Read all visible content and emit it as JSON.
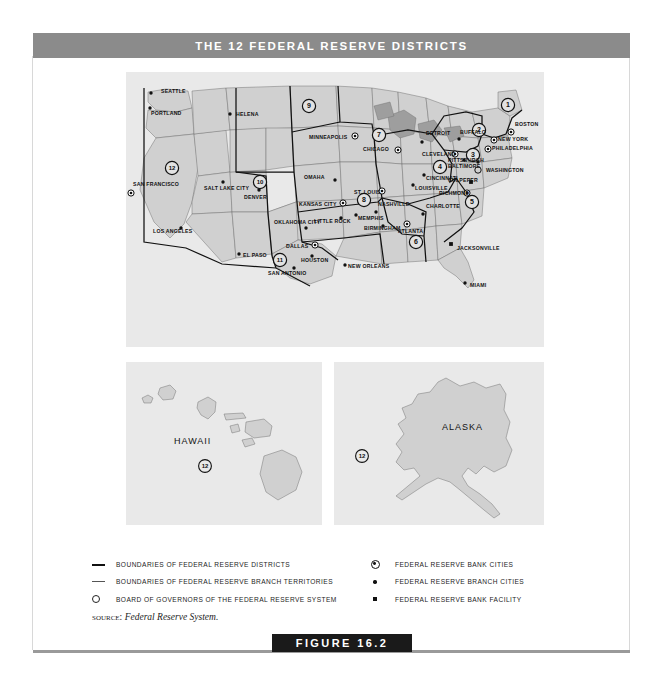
{
  "header": {
    "title_prefix": "T",
    "title": "THE 12 FEDERAL RESERVE DISTRICTS"
  },
  "figure": {
    "banner_label": "FIGURE 16.2"
  },
  "source": {
    "label": "SOURCE:",
    "value": "Federal Reserve System."
  },
  "legend": {
    "left": [
      {
        "marker": "thick-line-icon",
        "label": "Boundaries of Federal Reserve Districts"
      },
      {
        "marker": "thin-line-icon",
        "label": "Boundaries of Federal Reserve Branch territories"
      },
      {
        "marker": "board-of-governors-icon",
        "label": "Board of Governors of the Federal Reserve System"
      }
    ],
    "right": [
      {
        "marker": "reserve-bank-city-icon",
        "label": "Federal Reserve Bank cities"
      },
      {
        "marker": "branch-city-icon",
        "label": "Federal Reserve Branch cities"
      },
      {
        "marker": "bank-facility-icon",
        "label": "Federal Reserve Bank facility"
      }
    ]
  },
  "maps": {
    "main": {
      "name": "continental-united-states",
      "districts": [
        {
          "number": "1",
          "x": 382,
          "y": 33
        },
        {
          "number": "2",
          "x": 353,
          "y": 58
        },
        {
          "number": "3",
          "x": 347,
          "y": 83
        },
        {
          "number": "4",
          "x": 314,
          "y": 95
        },
        {
          "number": "5",
          "x": 346,
          "y": 130
        },
        {
          "number": "6",
          "x": 290,
          "y": 170
        },
        {
          "number": "7",
          "x": 253,
          "y": 63
        },
        {
          "number": "8",
          "x": 238,
          "y": 128
        },
        {
          "number": "9",
          "x": 183,
          "y": 34
        },
        {
          "number": "10",
          "x": 134,
          "y": 110
        },
        {
          "number": "11",
          "x": 154,
          "y": 188
        },
        {
          "number": "12",
          "x": 46,
          "y": 96
        }
      ],
      "cities": [
        {
          "name": "SEATTLE",
          "type": "branch",
          "lx": 35,
          "ly": 21,
          "dx": 25,
          "dy": 21,
          "anchor": "start"
        },
        {
          "name": "PORTLAND",
          "type": "branch",
          "lx": 25,
          "ly": 43,
          "dx": 24,
          "dy": 36,
          "anchor": "start"
        },
        {
          "name": "HELENA",
          "type": "branch",
          "lx": 110,
          "ly": 44,
          "dx": 104,
          "dy": 42,
          "anchor": "start"
        },
        {
          "name": "MINNEAPOLIS",
          "type": "bank",
          "lx": 183,
          "ly": 67,
          "dx": 229,
          "dy": 64,
          "anchor": "start"
        },
        {
          "name": "SAN FRANCISCO",
          "type": "bank",
          "lx": 7,
          "ly": 114,
          "dx": 5,
          "dy": 121,
          "anchor": "start"
        },
        {
          "name": "SALT LAKE CITY",
          "type": "branch",
          "lx": 78,
          "ly": 118,
          "dx": 97,
          "dy": 110,
          "anchor": "start"
        },
        {
          "name": "DENVER",
          "type": "branch",
          "lx": 118,
          "ly": 127,
          "dx": 133,
          "dy": 118,
          "anchor": "start"
        },
        {
          "name": "OMAHA",
          "type": "branch",
          "lx": 178,
          "ly": 107,
          "dx": 209,
          "dy": 108,
          "anchor": "start"
        },
        {
          "name": "KANSAS CITY",
          "type": "bank",
          "lx": 173,
          "ly": 134,
          "dx": 217,
          "dy": 131,
          "anchor": "start"
        },
        {
          "name": "CHICAGO",
          "type": "bank",
          "lx": 237,
          "ly": 79,
          "dx": 272,
          "dy": 78,
          "anchor": "start"
        },
        {
          "name": "DETROIT",
          "type": "branch",
          "lx": 300,
          "ly": 63,
          "dx": 296,
          "dy": 70,
          "anchor": "start"
        },
        {
          "name": "CLEVELAND",
          "type": "bank",
          "lx": 296,
          "ly": 84,
          "dx": 329,
          "dy": 82,
          "anchor": "start"
        },
        {
          "name": "ST. LOUIS",
          "type": "bank",
          "lx": 228,
          "ly": 122,
          "dx": 256,
          "dy": 119,
          "anchor": "start"
        },
        {
          "name": "LOUISVILLE",
          "type": "branch",
          "lx": 289,
          "ly": 118,
          "dx": 287,
          "dy": 113,
          "anchor": "start"
        },
        {
          "name": "CINCINNATI",
          "type": "branch",
          "lx": 300,
          "ly": 108,
          "dx": 298,
          "dy": 103,
          "anchor": "start"
        },
        {
          "name": "BUFFALO",
          "type": "branch",
          "lx": 334,
          "ly": 62,
          "dx": 333,
          "dy": 67,
          "anchor": "start"
        },
        {
          "name": "BOSTON",
          "type": "bank",
          "lx": 389,
          "ly": 54,
          "dx": 385,
          "dy": 60,
          "anchor": "start"
        },
        {
          "name": "NEW YORK",
          "type": "bank",
          "lx": 372,
          "ly": 69,
          "dx": 368,
          "dy": 68,
          "anchor": "start"
        },
        {
          "name": "PHILADELPHIA",
          "type": "bank",
          "lx": 366,
          "ly": 78,
          "dx": 362,
          "dy": 77,
          "anchor": "start"
        },
        {
          "name": "PITTSBURGH",
          "type": "branch",
          "lx": 322,
          "ly": 90,
          "dx": 338,
          "dy": 88,
          "anchor": "start"
        },
        {
          "name": "BALTIMORE",
          "type": "branch",
          "lx": 322,
          "ly": 96,
          "dx": 352,
          "dy": 90,
          "anchor": "start"
        },
        {
          "name": "WASHINGTON",
          "type": "board",
          "lx": 360,
          "ly": 100,
          "dx": 352,
          "dy": 98,
          "anchor": "start"
        },
        {
          "name": "CULPEPER",
          "type": "facility",
          "lx": 322,
          "ly": 110,
          "dx": 345,
          "dy": 110,
          "anchor": "start"
        },
        {
          "name": "RICHMOND",
          "type": "bank",
          "lx": 313,
          "ly": 123,
          "dx": 341,
          "dy": 121,
          "anchor": "start"
        },
        {
          "name": "CHARLOTTE",
          "type": "branch",
          "lx": 300,
          "ly": 136,
          "dx": 297,
          "dy": 142,
          "anchor": "start"
        },
        {
          "name": "NASHVILLE",
          "type": "branch",
          "lx": 252,
          "ly": 134,
          "dx": 250,
          "dy": 140,
          "anchor": "start"
        },
        {
          "name": "MEMPHIS",
          "type": "branch",
          "lx": 232,
          "ly": 148,
          "dx": 230,
          "dy": 143,
          "anchor": "start"
        },
        {
          "name": "LITTLE ROCK",
          "type": "branch",
          "lx": 188,
          "ly": 151,
          "dx": 215,
          "dy": 146,
          "anchor": "start"
        },
        {
          "name": "BIRMINGHAM",
          "type": "branch",
          "lx": 238,
          "ly": 158,
          "dx": 257,
          "dy": 154,
          "anchor": "start"
        },
        {
          "name": "ATLANTA",
          "type": "bank",
          "lx": 272,
          "ly": 161,
          "dx": 281,
          "dy": 152,
          "anchor": "start"
        },
        {
          "name": "JACKSONVILLE",
          "type": "facility",
          "lx": 331,
          "ly": 178,
          "dx": 325,
          "dy": 172,
          "anchor": "start"
        },
        {
          "name": "MIAMI",
          "type": "branch",
          "lx": 344,
          "ly": 215,
          "dx": 339,
          "dy": 211,
          "anchor": "start"
        },
        {
          "name": "NEW ORLEANS",
          "type": "branch",
          "lx": 222,
          "ly": 196,
          "dx": 219,
          "dy": 193,
          "anchor": "start"
        },
        {
          "name": "HOUSTON",
          "type": "branch",
          "lx": 175,
          "ly": 190,
          "dx": 186,
          "dy": 184,
          "anchor": "start"
        },
        {
          "name": "SAN ANTONIO",
          "type": "branch",
          "lx": 142,
          "ly": 203,
          "dx": 168,
          "dy": 196,
          "anchor": "start"
        },
        {
          "name": "DALLAS",
          "type": "bank",
          "lx": 160,
          "ly": 176,
          "dx": 189,
          "dy": 173,
          "anchor": "start"
        },
        {
          "name": "EL PASO",
          "type": "branch",
          "lx": 117,
          "ly": 185,
          "dx": 113,
          "dy": 182,
          "anchor": "start"
        },
        {
          "name": "OKLAHOMA CITY",
          "type": "branch",
          "lx": 148,
          "ly": 152,
          "dx": 180,
          "dy": 156,
          "anchor": "start"
        },
        {
          "name": "LOS ANGELES",
          "type": "branch",
          "lx": 27,
          "ly": 161,
          "dx": 55,
          "dy": 156,
          "anchor": "start"
        }
      ]
    },
    "hawaii": {
      "name": "hawaii-inset",
      "label": "HAWAII",
      "district": "12"
    },
    "alaska": {
      "name": "alaska-inset",
      "label": "ALASKA",
      "district": "12"
    }
  },
  "colors": {
    "title_bar": "#8b8b8b",
    "map_background": "#e9e9e9",
    "state_fill": "#d0d0d0",
    "banner": "#1a1a1a"
  }
}
